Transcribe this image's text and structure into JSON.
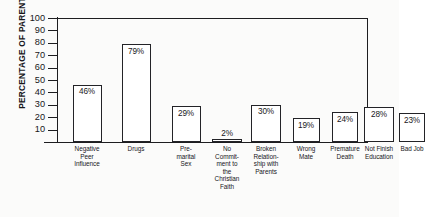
{
  "chart_data": {
    "type": "bar",
    "title": "",
    "xlabel": "",
    "ylabel": "PERCENTAGE OF PARENTS",
    "ylim": [
      0,
      100
    ],
    "yticks": [
      10,
      20,
      30,
      40,
      50,
      60,
      70,
      80,
      90,
      100
    ],
    "grid": false,
    "legend": "none",
    "categories": [
      "Negative Peer Influence",
      "Drugs",
      "Pre-marital Sex",
      "No Commitment to the Christian Faith",
      "Broken Relationship with Parents",
      "Wrong Mate",
      "Premature Death",
      "Not Finish Education",
      "Bad Job"
    ],
    "category_lines": [
      [
        "Negative",
        "Peer",
        "Influence"
      ],
      [
        "Drugs"
      ],
      [
        "Pre-",
        "marital",
        "Sex"
      ],
      [
        "No",
        "Commit-",
        "ment to",
        "the",
        "Christian",
        "Faith"
      ],
      [
        "Broken",
        "Relation-",
        "ship with",
        "Parents"
      ],
      [
        "Wrong",
        "Mate"
      ],
      [
        "Premature",
        "Death"
      ],
      [
        "Not Finish",
        "Education"
      ],
      [
        "Bad Job"
      ]
    ],
    "values": [
      46,
      79,
      29,
      2,
      30,
      19,
      24,
      28,
      23
    ],
    "value_labels": [
      "46%",
      "79%",
      "29%",
      "2%",
      "30%",
      "19%",
      "24%",
      "28%",
      "23%"
    ]
  },
  "style": {
    "bar_fill": "#ffffff",
    "bar_stroke": "#232327",
    "axis_color": "#1d1d20",
    "text_color": "#17171a",
    "background": "#fbfbfa"
  }
}
